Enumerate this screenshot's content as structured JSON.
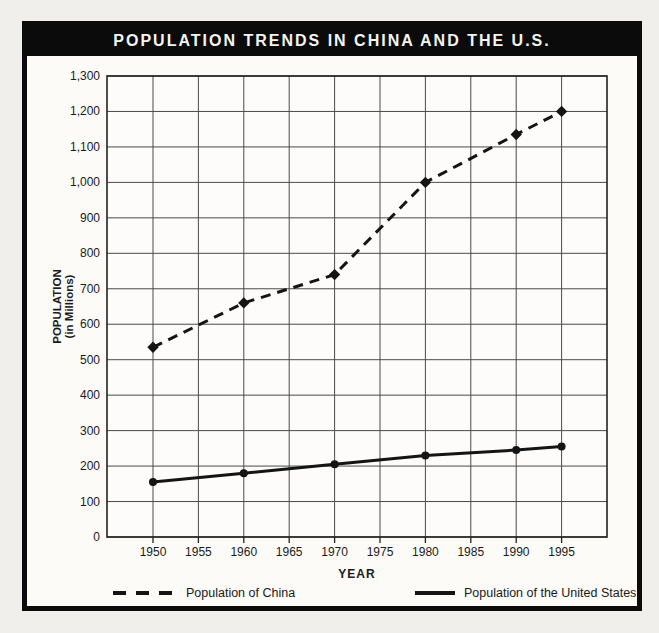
{
  "chart_data": {
    "type": "line",
    "title": "POPULATION TRENDS IN CHINA AND THE U.S.",
    "xlabel": "YEAR",
    "ylabel": "POPULATION",
    "ylabel_sub": "(in Millions)",
    "x_ticks": [
      1950,
      1955,
      1960,
      1965,
      1970,
      1975,
      1980,
      1985,
      1990,
      1995
    ],
    "y_ticks": [
      0,
      100,
      200,
      300,
      400,
      500,
      600,
      700,
      800,
      900,
      1000,
      1100,
      1200,
      1300
    ],
    "ylim": [
      0,
      1300
    ],
    "xlim": [
      1945,
      2000
    ],
    "grid": true,
    "legend_position": "bottom",
    "series": [
      {
        "name": "Population of China",
        "style": "dashed",
        "marker": "diamond",
        "x": [
          1950,
          1960,
          1970,
          1980,
          1990,
          1995
        ],
        "values": [
          535,
          660,
          740,
          1000,
          1135,
          1200
        ]
      },
      {
        "name": "Population of the United States",
        "style": "solid",
        "marker": "circle",
        "x": [
          1950,
          1960,
          1970,
          1980,
          1990,
          1995
        ],
        "values": [
          155,
          180,
          205,
          230,
          245,
          255
        ]
      }
    ],
    "colors": {
      "line": "#141414",
      "grid": "#4a4a4a",
      "plot_border": "#222222",
      "frame": "#0b0b0b",
      "title_text": "#f4f4f1",
      "paper": "#f0efeb",
      "plot_bg": "#fdfcfa",
      "label_text": "#1a1a1a"
    }
  }
}
